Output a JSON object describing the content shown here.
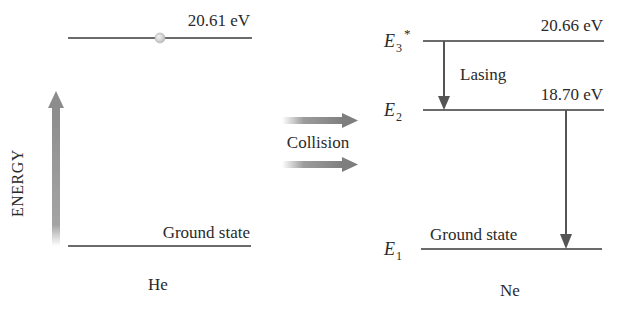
{
  "diagram": {
    "type": "energy-level-diagram",
    "axis_label": "ENERGY",
    "transfer_label": "Collision",
    "colors": {
      "line": "#3a3a3a",
      "arrow_gray": "#8a8a8a",
      "text": "#2a2a2a"
    },
    "he": {
      "name": "He",
      "excited": {
        "energy": "20.61 eV"
      },
      "ground": {
        "label": "Ground state"
      }
    },
    "ne": {
      "name": "Ne",
      "levels": [
        {
          "symbol": "E",
          "subscript": "3",
          "superscript": "*",
          "energy": "20.66 eV"
        },
        {
          "symbol": "E",
          "subscript": "2",
          "energy": "18.70 eV"
        },
        {
          "symbol": "E",
          "subscript": "1",
          "label": "Ground state"
        }
      ],
      "transition_label": "Lasing"
    }
  }
}
